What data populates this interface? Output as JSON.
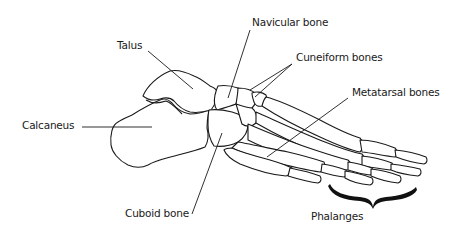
{
  "diagram": {
    "labels": {
      "talus": "Talus",
      "navicular": "Navicular bone",
      "cuneiform": "Cuneiform bones",
      "metatarsal": "Metatarsal bones",
      "calcaneus": "Calcaneus",
      "cuboid": "Cuboid bone",
      "phalanges": "Phalanges"
    },
    "colors": {
      "line": "#1a1a1a",
      "background": "#ffffff"
    }
  }
}
